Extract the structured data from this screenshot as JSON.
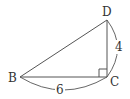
{
  "diagram": {
    "type": "right-triangle",
    "vertices": [
      {
        "id": "B",
        "label": "B",
        "x": 20,
        "y": 77
      },
      {
        "id": "C",
        "label": "C",
        "x": 107,
        "y": 77
      },
      {
        "id": "D",
        "label": "D",
        "x": 107,
        "y": 20
      }
    ],
    "right_angle_at": "C",
    "measurements": [
      {
        "segment": "BC",
        "label": "6"
      },
      {
        "segment": "CD",
        "label": "4"
      }
    ],
    "colors": {
      "stroke": "#555555",
      "text": "#333333",
      "background": "#ffffff"
    }
  }
}
